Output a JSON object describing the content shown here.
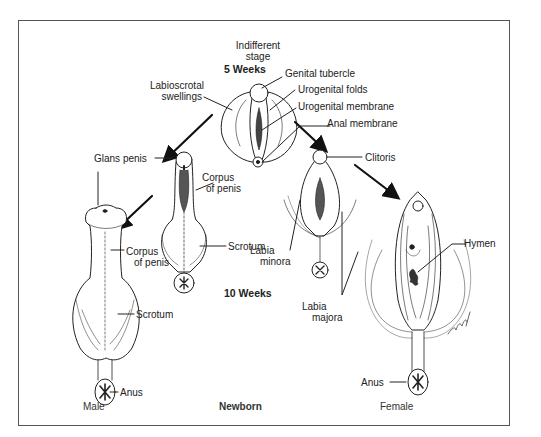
{
  "figure": {
    "indifferent_stage": {
      "title_line1": "Indifferent",
      "title_line2": "stage",
      "age": "5 Weeks",
      "labels": {
        "genital_tubercle": "Genital tubercle",
        "urogenital_folds": "Urogenital folds",
        "urogenital_membrane": "Urogenital membrane",
        "anal_membrane": "Anal membrane",
        "labioscrotal_line1": "Labioscrotal",
        "labioscrotal_line2": "swellings"
      }
    },
    "male": {
      "glans_penis": "Glans penis",
      "corpus_10wk_line1": "Corpus",
      "corpus_10wk_line2": "of penis",
      "scrotum_10wk": "Scrotum",
      "corpus_newborn_line1": "Corpus",
      "corpus_newborn_line2": "of penis",
      "scrotum_newborn": "Scrotum",
      "anus": "Anus"
    },
    "female": {
      "clitoris": "Clitoris",
      "labia_minora_line1": "Labia",
      "labia_minora_line2": "minora",
      "labia_majora_line1": "Labia",
      "labia_majora_line2": "majora",
      "hymen": "Hymen",
      "anus": "Anus"
    },
    "stage_10_weeks": "10 Weeks",
    "bottom_captions": {
      "male": "Male",
      "newborn": "Newborn",
      "female": "Female"
    },
    "colors": {
      "ink": "#222222",
      "frame": "#555555",
      "background": "#ffffff"
    }
  }
}
